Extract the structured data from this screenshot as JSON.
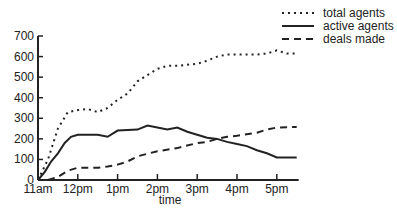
{
  "chart_data": {
    "type": "line",
    "title": "",
    "xlabel": "time",
    "ylabel": "",
    "ylim": [
      0,
      700
    ],
    "yticks": [
      0,
      100,
      200,
      300,
      400,
      500,
      600,
      700
    ],
    "xticks": [
      {
        "label": "11am",
        "h": 0
      },
      {
        "label": "12pm",
        "h": 1
      },
      {
        "label": "1pm",
        "h": 2
      },
      {
        "label": "2pm",
        "h": 3
      },
      {
        "label": "3pm",
        "h": 4
      },
      {
        "label": "4pm",
        "h": 5
      },
      {
        "label": "5pm",
        "h": 6
      }
    ],
    "xlim_hours_after_11am": [
      0,
      6.55
    ],
    "grid": false,
    "legend_position": "top-right",
    "series": [
      {
        "name": "total agents",
        "style": "dotted",
        "points": [
          [
            0,
            0
          ],
          [
            0.25,
            100
          ],
          [
            0.5,
            250
          ],
          [
            0.75,
            330
          ],
          [
            1.0,
            340
          ],
          [
            1.25,
            345
          ],
          [
            1.5,
            330
          ],
          [
            1.75,
            350
          ],
          [
            2.0,
            390
          ],
          [
            2.25,
            420
          ],
          [
            2.5,
            480
          ],
          [
            2.75,
            510
          ],
          [
            3.0,
            540
          ],
          [
            3.25,
            555
          ],
          [
            3.5,
            555
          ],
          [
            3.75,
            560
          ],
          [
            4.0,
            565
          ],
          [
            4.25,
            580
          ],
          [
            4.5,
            600
          ],
          [
            4.75,
            610
          ],
          [
            5.0,
            610
          ],
          [
            5.5,
            610
          ],
          [
            5.75,
            615
          ],
          [
            6.0,
            630
          ],
          [
            6.25,
            615
          ],
          [
            6.5,
            615
          ]
        ]
      },
      {
        "name": "active agents",
        "style": "solid",
        "points": [
          [
            0,
            0
          ],
          [
            0.17,
            40
          ],
          [
            0.33,
            90
          ],
          [
            0.5,
            130
          ],
          [
            0.67,
            180
          ],
          [
            0.83,
            210
          ],
          [
            1.0,
            220
          ],
          [
            1.5,
            220
          ],
          [
            1.75,
            210
          ],
          [
            2.0,
            240
          ],
          [
            2.5,
            245
          ],
          [
            2.75,
            265
          ],
          [
            3.0,
            255
          ],
          [
            3.25,
            245
          ],
          [
            3.5,
            255
          ],
          [
            3.75,
            235
          ],
          [
            4.0,
            220
          ],
          [
            4.25,
            205
          ],
          [
            4.5,
            200
          ],
          [
            4.75,
            185
          ],
          [
            5.0,
            175
          ],
          [
            5.25,
            165
          ],
          [
            5.5,
            145
          ],
          [
            5.75,
            130
          ],
          [
            6.0,
            110
          ],
          [
            6.5,
            110
          ]
        ]
      },
      {
        "name": "deals made",
        "style": "dashed",
        "points": [
          [
            0.25,
            0
          ],
          [
            0.5,
            15
          ],
          [
            0.75,
            45
          ],
          [
            1.0,
            60
          ],
          [
            1.5,
            60
          ],
          [
            1.75,
            65
          ],
          [
            2.0,
            75
          ],
          [
            2.25,
            90
          ],
          [
            2.5,
            115
          ],
          [
            3.0,
            140
          ],
          [
            3.5,
            155
          ],
          [
            4.0,
            180
          ],
          [
            4.25,
            185
          ],
          [
            4.5,
            200
          ],
          [
            4.75,
            210
          ],
          [
            5.0,
            215
          ],
          [
            5.5,
            230
          ],
          [
            5.75,
            245
          ],
          [
            6.0,
            255
          ],
          [
            6.5,
            258
          ]
        ]
      }
    ]
  }
}
